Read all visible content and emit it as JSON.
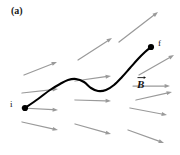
{
  "figure": {
    "panel_label": "(a)",
    "background_color": "#ffffff",
    "width": 180,
    "height": 155
  },
  "labels": {
    "start_point": "i",
    "end_point": "f",
    "field_symbol": "B",
    "field_symbol_notation": "vector-arrow-over-B"
  },
  "colors": {
    "field_arrow": "#9a9a9a",
    "path_curve": "#000000",
    "point_marker": "#000000",
    "text": "#111111"
  },
  "chart_data": {
    "type": "diagram",
    "title": "(a)",
    "path_curve": {
      "name": "particle-path",
      "color": "#000000",
      "stroke_width": 2.1,
      "start": [
        25,
        108
      ],
      "end": [
        151,
        47
      ],
      "points": [
        [
          25,
          108
        ],
        [
          38,
          99
        ],
        [
          50,
          90
        ],
        [
          60,
          84
        ],
        [
          68,
          80
        ],
        [
          76,
          79
        ],
        [
          84,
          82
        ],
        [
          91,
          88
        ],
        [
          98,
          91
        ],
        [
          106,
          90
        ],
        [
          114,
          85
        ],
        [
          122,
          77
        ],
        [
          130,
          68
        ],
        [
          138,
          59
        ],
        [
          145,
          52
        ],
        [
          151,
          47
        ]
      ]
    },
    "markers": [
      {
        "name": "start-marker",
        "label": "i",
        "x": 25,
        "y": 108,
        "radius": 3.1
      },
      {
        "name": "end-marker",
        "label": "f",
        "x": 151,
        "y": 47,
        "radius": 3.1
      }
    ],
    "field_arrows": [
      {
        "x1": 119,
        "y1": 42,
        "x2": 158,
        "y2": 12,
        "angle_deg": -37.6
      },
      {
        "x1": 78,
        "y1": 60,
        "x2": 112,
        "y2": 38,
        "angle_deg": -32.9
      },
      {
        "x1": 139,
        "y1": 75,
        "x2": 174,
        "y2": 55,
        "angle_deg": -29.7
      },
      {
        "x1": 24,
        "y1": 75,
        "x2": 57,
        "y2": 62,
        "angle_deg": -21.5
      },
      {
        "x1": 136,
        "y1": 100,
        "x2": 172,
        "y2": 92,
        "angle_deg": -12.5
      },
      {
        "x1": 75,
        "y1": 81,
        "x2": 111,
        "y2": 76,
        "angle_deg": -7.9
      },
      {
        "x1": 22,
        "y1": 93,
        "x2": 58,
        "y2": 89,
        "angle_deg": -6.3
      },
      {
        "x1": 133,
        "y1": 86,
        "x2": 170,
        "y2": 86,
        "angle_deg": 0.0
      },
      {
        "x1": 75,
        "y1": 100,
        "x2": 111,
        "y2": 101,
        "angle_deg": 1.6
      },
      {
        "x1": 22,
        "y1": 108,
        "x2": 58,
        "y2": 110,
        "angle_deg": 3.2
      },
      {
        "x1": 130,
        "y1": 108,
        "x2": 167,
        "y2": 115,
        "angle_deg": 10.7
      },
      {
        "x1": 22,
        "y1": 122,
        "x2": 58,
        "y2": 130,
        "angle_deg": 12.5
      },
      {
        "x1": 75,
        "y1": 124,
        "x2": 111,
        "y2": 134,
        "angle_deg": 15.5
      },
      {
        "x1": 128,
        "y1": 130,
        "x2": 164,
        "y2": 143,
        "angle_deg": 19.9
      }
    ],
    "field_label": {
      "text": "B",
      "x": 143,
      "y": 87,
      "style": "bold-italic-with-overarrow"
    }
  }
}
